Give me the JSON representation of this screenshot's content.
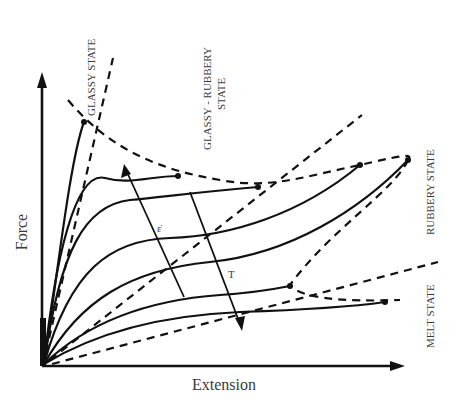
{
  "diagram": {
    "type": "force-extension curves of a polymer at varying temperature and strain rate",
    "x_axis_label": "Extension",
    "y_axis_label": "Force",
    "regions": [
      {
        "id": "glassy",
        "label": "GLASSY STATE"
      },
      {
        "id": "glassy-rubbery",
        "label_line1": "GLASSY - RUBBERY",
        "label_line2": "STATE"
      },
      {
        "id": "rubbery",
        "label": "RUBBERY STATE"
      },
      {
        "id": "melt",
        "label": "MELT STATE"
      }
    ],
    "arrows": [
      {
        "id": "strain-rate-arrow",
        "label": "ε̇",
        "direction": "up-left (increasing)"
      },
      {
        "id": "temperature-arrow",
        "label": "T",
        "direction": "down-right (increasing)"
      }
    ],
    "curve_count_solid": 8,
    "boundary_lines_dashed": 5
  }
}
